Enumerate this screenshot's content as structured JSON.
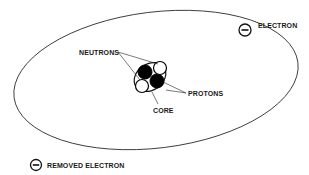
{
  "diagram": {
    "title": "",
    "labels": {
      "electron": "ELECTRON",
      "neutrons": "NEUTRONS",
      "protons": "PROTONS",
      "core": "CORE",
      "removed_electron": "REMOVED ELECTRON"
    },
    "symbols": {
      "electron_charge": "minus",
      "removed_electron_charge": "minus"
    },
    "colors": {
      "line": "#1a1a1a",
      "proton_fill": "#000000",
      "neutron_fill": "#ffffff",
      "background": "#ffffff"
    },
    "nucleus": {
      "protons": 2,
      "neutrons": 2
    }
  }
}
